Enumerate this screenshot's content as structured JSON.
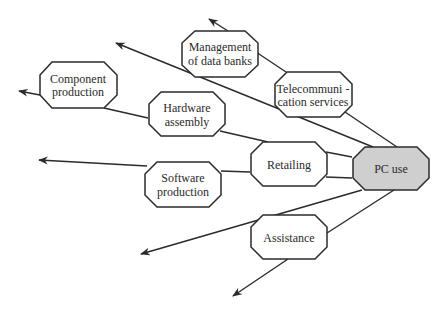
{
  "diagram": {
    "type": "network-diagram",
    "center": {
      "id": "pc_use",
      "label": "PC use",
      "fill": "#cfcfcf"
    },
    "nodes": [
      {
        "id": "management",
        "lines": [
          "Management",
          "of data banks"
        ]
      },
      {
        "id": "telecom",
        "lines": [
          "Telecommuni -",
          "cation services"
        ]
      },
      {
        "id": "component",
        "lines": [
          "Component",
          "production"
        ]
      },
      {
        "id": "hardware",
        "lines": [
          "Hardware",
          "assembly"
        ]
      },
      {
        "id": "retailing",
        "lines": [
          "Retailing"
        ]
      },
      {
        "id": "pc_use",
        "lines": [
          "PC use"
        ]
      },
      {
        "id": "software",
        "lines": [
          "Software",
          "production"
        ]
      },
      {
        "id": "assistance",
        "lines": [
          "Assistance"
        ]
      }
    ],
    "edges": [
      {
        "from": "pc_use",
        "to": "telecom"
      },
      {
        "from": "telecom",
        "to": "management"
      },
      {
        "from": "management",
        "to": "arrow-out"
      },
      {
        "from": "pc_use",
        "to": "arrow-out",
        "note": "long line to upper left"
      },
      {
        "from": "pc_use",
        "to": "retailing",
        "note": "two connecting lines"
      },
      {
        "from": "retailing",
        "to": "hardware"
      },
      {
        "from": "hardware",
        "to": "component"
      },
      {
        "from": "component",
        "to": "arrow-out"
      },
      {
        "from": "retailing",
        "to": "software"
      },
      {
        "from": "software",
        "to": "arrow-out"
      },
      {
        "from": "pc_use",
        "to": "assistance"
      },
      {
        "from": "assistance",
        "to": "arrow-out"
      },
      {
        "from": "pc_use",
        "to": "arrow-out",
        "note": "long line to lower left"
      }
    ]
  }
}
